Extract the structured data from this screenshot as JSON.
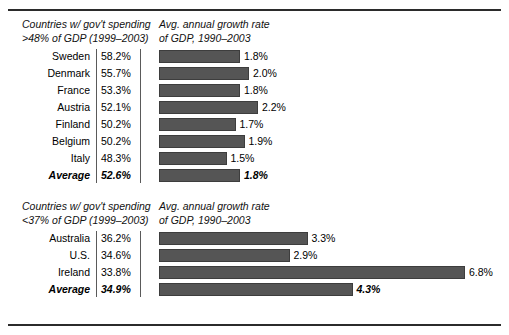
{
  "chart_data": {
    "type": "bar",
    "title": "",
    "xlabel": "",
    "ylabel": "",
    "panels": [
      {
        "id": "high-spending",
        "header_left": "Countries w/ gov't spending\n>48% of GDP (1999–2003)",
        "header_right": "Avg. annual growth rate\nof GDP, 1990–2003",
        "categories": [
          "Sweden",
          "Denmark",
          "France",
          "Austria",
          "Finland",
          "Belgium",
          "Italy",
          "Average"
        ],
        "spending_labels": [
          "58.2%",
          "55.7%",
          "53.3%",
          "52.1%",
          "50.2%",
          "50.2%",
          "48.3%",
          "52.6%"
        ],
        "spending_values": [
          58.2,
          55.7,
          53.3,
          52.1,
          50.2,
          50.2,
          48.3,
          52.6
        ],
        "growth_labels": [
          "1.8%",
          "2.0%",
          "1.8%",
          "2.2%",
          "1.7%",
          "1.9%",
          "1.5%",
          "1.8%"
        ],
        "growth_values": [
          1.8,
          2.0,
          1.8,
          2.2,
          1.7,
          1.9,
          1.5,
          1.8
        ],
        "average_index": 7
      },
      {
        "id": "low-spending",
        "header_left": "Countries w/ gov't spending\n<37% of GDP (1999–2003)",
        "header_right": "Avg. annual growth rate\nof GDP, 1990–2003",
        "categories": [
          "Australia",
          "U.S.",
          "Ireland",
          "Average"
        ],
        "spending_labels": [
          "36.2%",
          "34.6%",
          "33.8%",
          "34.9%"
        ],
        "spending_values": [
          36.2,
          34.6,
          33.8,
          34.9
        ],
        "growth_labels": [
          "3.3%",
          "2.9%",
          "6.8%",
          "4.3%"
        ],
        "growth_values": [
          3.3,
          2.9,
          6.8,
          4.3
        ],
        "average_index": 3
      }
    ],
    "bar_scale_px_per_percent": 45,
    "bar_color": "#555555",
    "xlim": [
      0,
      7
    ],
    "grid": false,
    "legend": null
  }
}
